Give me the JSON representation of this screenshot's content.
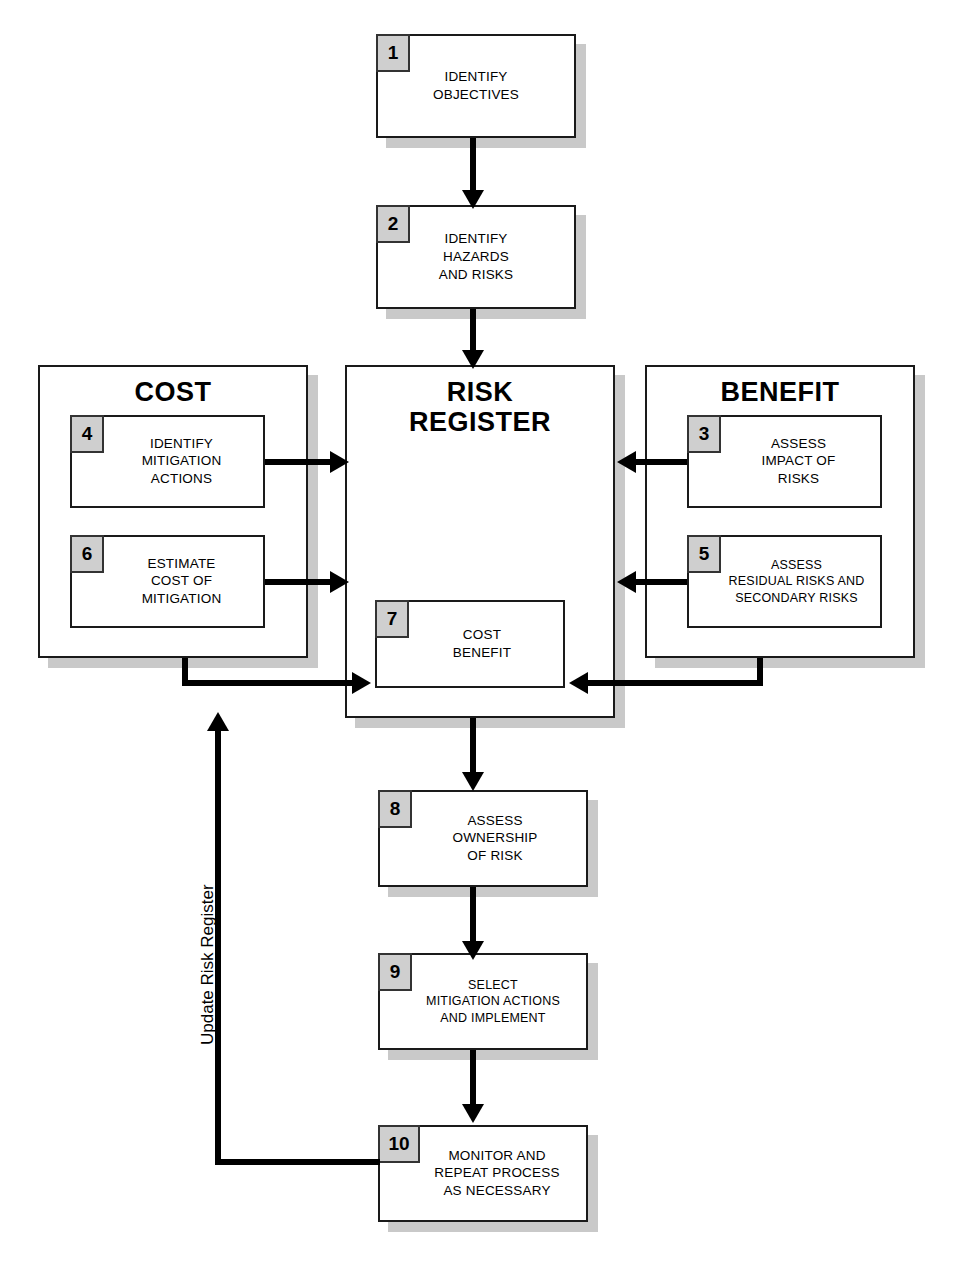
{
  "diagram": {
    "groups": [
      {
        "id": "cost",
        "title": "COST"
      },
      {
        "id": "risk_register",
        "title": "RISK\nREGISTER"
      },
      {
        "id": "benefit",
        "title": "BENEFIT"
      }
    ],
    "nodes": [
      {
        "num": "1",
        "text": "IDENTIFY\nOBJECTIVES"
      },
      {
        "num": "2",
        "text": "IDENTIFY\nHAZARDS\nAND RISKS"
      },
      {
        "num": "3",
        "text": "ASSESS\nIMPACT OF\nRISKS"
      },
      {
        "num": "4",
        "text": "IDENTIFY\nMITIGATION\nACTIONS"
      },
      {
        "num": "5",
        "text": "ASSESS\nRESIDUAL RISKS AND\nSECONDARY RISKS"
      },
      {
        "num": "6",
        "text": "ESTIMATE\nCOST OF\nMITIGATION"
      },
      {
        "num": "7",
        "text": "COST\nBENEFIT"
      },
      {
        "num": "8",
        "text": "ASSESS\nOWNERSHIP\nOF RISK"
      },
      {
        "num": "9",
        "text": "SELECT\nMITIGATION ACTIONS\nAND IMPLEMENT"
      },
      {
        "num": "10",
        "text": "MONITOR AND\nREPEAT PROCESS\nAS NECESSARY"
      }
    ],
    "annotations": [
      {
        "id": "feedback",
        "text": "Update Risk Register"
      }
    ],
    "colors": {
      "stroke": "#1a1a1a",
      "connector": "#000000",
      "shadow": "#c9c9c9",
      "number_tab_fill": "#cfcfcf",
      "background": "#ffffff"
    }
  }
}
